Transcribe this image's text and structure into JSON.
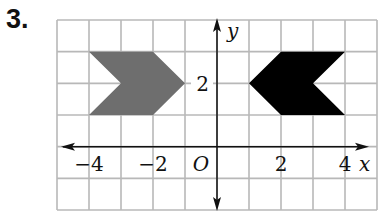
{
  "problem": {
    "number": "3."
  },
  "grid": {
    "x_min": -5,
    "x_max": 5,
    "y_min": -2,
    "y_max": 4,
    "left_px": 57,
    "right_px": 377,
    "top_px": 20,
    "bottom_px": 210,
    "line_color": "#b8b8b8"
  },
  "axes": {
    "x_label": "x",
    "y_label": "y",
    "origin_label": "O",
    "x_ticks": [
      {
        "value": -4,
        "label": "−4"
      },
      {
        "value": -2,
        "label": "−2"
      },
      {
        "value": 2,
        "label": "2"
      },
      {
        "value": 4,
        "label": "4"
      }
    ],
    "y_ticks": [
      {
        "value": 2,
        "label": "2"
      }
    ],
    "color": "#111111"
  },
  "shapes": [
    {
      "name": "gray-arrow-shape",
      "fill": "#6e6e6e",
      "vertices": [
        [
          -4,
          3
        ],
        [
          -2,
          3
        ],
        [
          -1,
          2
        ],
        [
          -2,
          1
        ],
        [
          -4,
          1
        ],
        [
          -3,
          2
        ]
      ]
    },
    {
      "name": "black-arrow-shape",
      "fill": "#000000",
      "vertices": [
        [
          1,
          2
        ],
        [
          2,
          3
        ],
        [
          4,
          3
        ],
        [
          3,
          2
        ],
        [
          4,
          1
        ],
        [
          2,
          1
        ]
      ]
    }
  ]
}
